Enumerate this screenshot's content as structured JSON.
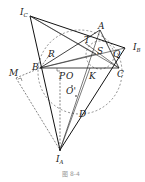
{
  "diagram": {
    "points": {
      "I_C": {
        "label": "I",
        "sub": "C",
        "x": 30,
        "y": 16
      },
      "A": {
        "label": "A",
        "x": 100,
        "y": 30
      },
      "I_B": {
        "label": "I",
        "sub": "B",
        "x": 125,
        "y": 48
      },
      "T": {
        "label": "T",
        "x": 85,
        "y": 43
      },
      "S": {
        "label": "S",
        "x": 96,
        "y": 54
      },
      "Q": {
        "label": "Q",
        "x": 113,
        "y": 56
      },
      "R": {
        "label": "R",
        "x": 48,
        "y": 54
      },
      "B": {
        "label": "B",
        "x": 40,
        "y": 68
      },
      "C": {
        "label": "C",
        "x": 119,
        "y": 68
      },
      "M": {
        "label": "M",
        "x": 16,
        "y": 75
      },
      "P": {
        "label": "P",
        "x": 62,
        "y": 77
      },
      "O": {
        "label": "O",
        "x": 70,
        "y": 77
      },
      "K": {
        "label": "K",
        "x": 90,
        "y": 77
      },
      "O_prime": {
        "label": "O'",
        "x": 77,
        "y": 90
      },
      "D": {
        "label": "D",
        "x": 82,
        "y": 116
      },
      "I_A": {
        "label": "I",
        "sub": "A",
        "x": 60,
        "y": 150
      }
    },
    "caption": "图 8-4"
  }
}
